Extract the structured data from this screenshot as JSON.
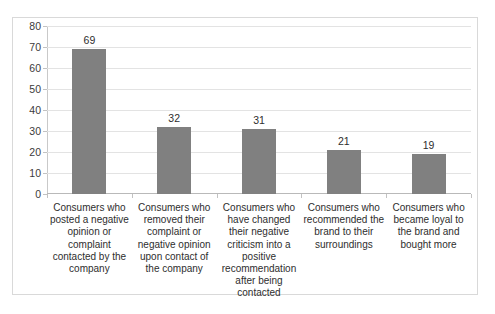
{
  "clipped_top_text": "",
  "chart_data": {
    "type": "bar",
    "title": "",
    "xlabel": "",
    "ylabel": "",
    "ylim": [
      0,
      80
    ],
    "ytick_step": 10,
    "ytick_labels": [
      "80",
      "70",
      "60",
      "50",
      "40",
      "30",
      "20",
      "10",
      "0"
    ],
    "grid": true,
    "grid_axis": "y",
    "legend": false,
    "bar_color": "#808080",
    "categories": [
      "Consumers who posted a negative opinion or complaint contacted by the company",
      "Consumers who removed their complaint or negative opinion upon contact of the company",
      "Consumers who have changed their negative criticism into a positive recommendation after being contacted",
      "Consumers who recommended the brand to their surroundings",
      "Consumers who became loyal to the brand and bought more"
    ],
    "values": [
      69,
      32,
      31,
      21,
      19
    ],
    "value_labels": [
      "69",
      "32",
      "31",
      "21",
      "19"
    ]
  }
}
